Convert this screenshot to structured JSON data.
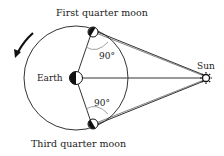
{
  "diagram": {
    "labels": {
      "first_quarter": "First quarter moon",
      "third_quarter": "Third quarter moon",
      "earth": "Earth",
      "sun": "Sun",
      "angle_top": "90°",
      "angle_bottom": "90°"
    },
    "colors": {
      "line": "#333333",
      "dark": "#111111",
      "light": "#ffffff",
      "arc": "#888888"
    }
  }
}
